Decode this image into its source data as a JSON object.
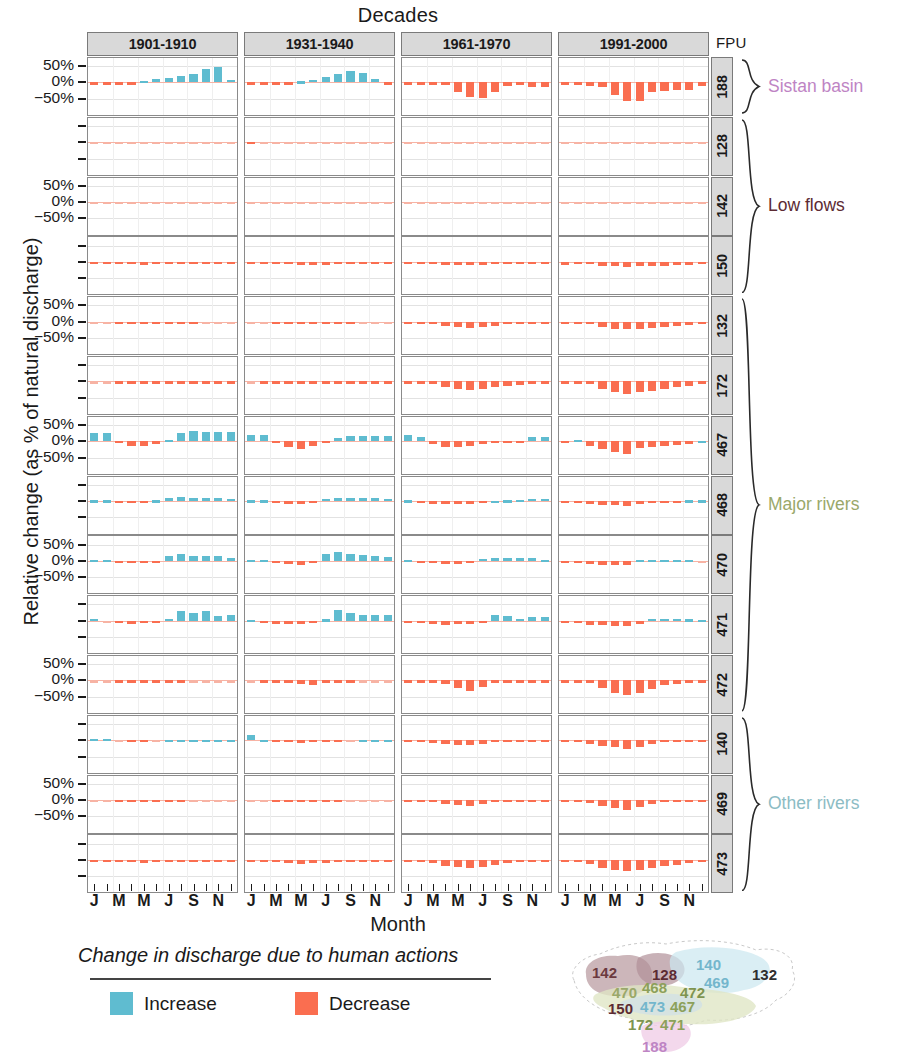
{
  "titles": {
    "top": "Decades",
    "y_axis": "Relative change (as % of natural discharge)",
    "x_axis": "Month",
    "fpu_header": "FPU"
  },
  "legend": {
    "title": "Change in discharge due to human actions",
    "increase_label": "Increase",
    "decrease_label": "Decrease",
    "increase_color": "#5FBCD0",
    "decrease_color": "#FA6E50"
  },
  "groups": [
    {
      "label": "Sistan basin",
      "color": "#BE84C4",
      "rows": [
        "188"
      ]
    },
    {
      "label": "Low flows",
      "color": "#5C2B33",
      "rows": [
        "128",
        "142",
        "150"
      ]
    },
    {
      "label": "Major rivers",
      "color": "#9AA86A",
      "rows": [
        "132",
        "172",
        "467",
        "468",
        "470",
        "471",
        "472"
      ]
    },
    {
      "label": "Other rivers",
      "color": "#8CBCC4",
      "rows": [
        "140",
        "469",
        "473"
      ]
    }
  ],
  "map": {
    "labels": [
      {
        "text": "142",
        "color": "#6B3A3F",
        "x": 36,
        "y": 30
      },
      {
        "text": "128",
        "color": "#5C2B33",
        "x": 96,
        "y": 32
      },
      {
        "text": "140",
        "color": "#73B6CC",
        "x": 140,
        "y": 22
      },
      {
        "text": "469",
        "color": "#73B6CC",
        "x": 148,
        "y": 40
      },
      {
        "text": "132",
        "color": "#2F2F2F",
        "x": 196,
        "y": 32
      },
      {
        "text": "470",
        "color": "#9AA86A",
        "x": 56,
        "y": 50
      },
      {
        "text": "468",
        "color": "#8CA05A",
        "x": 86,
        "y": 45
      },
      {
        "text": "472",
        "color": "#7E9450",
        "x": 124,
        "y": 50
      },
      {
        "text": "150",
        "color": "#5C2B33",
        "x": 52,
        "y": 66
      },
      {
        "text": "473",
        "color": "#73B6CC",
        "x": 84,
        "y": 64
      },
      {
        "text": "467",
        "color": "#8CA05A",
        "x": 114,
        "y": 64
      },
      {
        "text": "172",
        "color": "#7E9450",
        "x": 72,
        "y": 82
      },
      {
        "text": "471",
        "color": "#8CA05A",
        "x": 104,
        "y": 82
      },
      {
        "text": "188",
        "color": "#BE84C4",
        "x": 86,
        "y": 104
      }
    ]
  },
  "chart_data": {
    "type": "bar",
    "title": "Decades",
    "xlabel": "Month",
    "ylabel": "Relative change (as % of natural discharge)",
    "ylim": [
      -100,
      75
    ],
    "yticks": [
      50,
      0,
      -50
    ],
    "ytick_labels": [
      "50%",
      "0%",
      "−50%"
    ],
    "grid": true,
    "legend_position": "bottom",
    "facet_cols": [
      "1901-1910",
      "1931-1940",
      "1961-1970",
      "1991-2000"
    ],
    "facet_rows": [
      "188",
      "128",
      "142",
      "150",
      "132",
      "172",
      "467",
      "468",
      "470",
      "471",
      "472",
      "140",
      "469",
      "473"
    ],
    "x": [
      "J",
      "F",
      "M",
      "A",
      "M",
      "J",
      "J",
      "A",
      "S",
      "O",
      "N",
      "D"
    ],
    "xtick_labels": [
      "J",
      "M",
      "M",
      "J",
      "S",
      "N"
    ],
    "values": {
      "188": {
        "1901-1910": [
          -3,
          -3,
          -3,
          -1,
          5,
          10,
          14,
          20,
          26,
          40,
          48,
          8
        ],
        "1931-1940": [
          -3,
          -3,
          -3,
          -3,
          3,
          8,
          16,
          26,
          34,
          30,
          10,
          -1
        ],
        "1961-1970": [
          -8,
          -8,
          -8,
          -8,
          -28,
          -46,
          -48,
          -30,
          -12,
          -1,
          -14,
          -14
        ],
        "1991-2000": [
          -8,
          -8,
          -12,
          -14,
          -38,
          -58,
          -56,
          -30,
          -26,
          -24,
          -22,
          -12
        ]
      },
      "128": {
        "1901-1910": [
          0,
          0,
          0,
          0,
          0,
          0,
          0,
          0,
          0,
          0,
          0,
          0
        ],
        "1931-1940": [
          -6,
          0,
          0,
          0,
          0,
          0,
          0,
          0,
          0,
          0,
          0,
          0
        ],
        "1961-1970": [
          0,
          0,
          0,
          0,
          0,
          0,
          0,
          0,
          0,
          0,
          0,
          0
        ],
        "1991-2000": [
          0,
          0,
          0,
          0,
          0,
          0,
          0,
          0,
          0,
          0,
          0,
          0
        ]
      },
      "142": {
        "1901-1910": [
          0,
          0,
          0,
          0,
          0,
          0,
          0,
          0,
          0,
          0,
          0,
          0
        ],
        "1931-1940": [
          0,
          0,
          0,
          0,
          0,
          0,
          0,
          0,
          0,
          0,
          0,
          0
        ],
        "1961-1970": [
          0,
          0,
          0,
          0,
          0,
          0,
          0,
          0,
          0,
          0,
          0,
          0
        ],
        "1991-2000": [
          0,
          0,
          0,
          0,
          0,
          0,
          0,
          0,
          0,
          0,
          0,
          0
        ]
      },
      "150": {
        "1901-1910": [
          -1,
          -1,
          -2,
          -7,
          -9,
          -8,
          -8,
          -8,
          -7,
          -2,
          -1,
          -1
        ],
        "1931-1940": [
          -1,
          -1,
          -3,
          -7,
          -10,
          -11,
          -9,
          -7,
          -4,
          -2,
          -1,
          -1
        ],
        "1961-1970": [
          -4,
          -3,
          -3,
          -9,
          -9,
          -10,
          -9,
          -7,
          -5,
          -4,
          -6,
          -6
        ],
        "1991-2000": [
          -9,
          -6,
          -6,
          -12,
          -14,
          -15,
          -14,
          -13,
          -12,
          -11,
          -10,
          -7
        ]
      },
      "132": {
        "1901-1910": [
          0,
          0,
          -1,
          -2,
          -3,
          -3,
          -3,
          -2,
          -1,
          0,
          0,
          0
        ],
        "1931-1940": [
          0,
          0,
          -2,
          -6,
          -7,
          -7,
          -6,
          -3,
          -1,
          0,
          0,
          0
        ],
        "1961-1970": [
          -4,
          -4,
          -3,
          -12,
          -16,
          -19,
          -16,
          -12,
          -8,
          -6,
          -5,
          -5
        ],
        "1991-2000": [
          -6,
          -6,
          -7,
          -18,
          -22,
          -24,
          -22,
          -20,
          -16,
          -12,
          -9,
          -7
        ]
      },
      "172": {
        "1901-1910": [
          0,
          0,
          -1,
          -3,
          -4,
          -4,
          -4,
          -3,
          -2,
          -1,
          -1,
          -1
        ],
        "1931-1940": [
          0,
          -1,
          -3,
          -8,
          -9,
          -9,
          -8,
          -5,
          -3,
          -2,
          -1,
          -1
        ],
        "1961-1970": [
          -3,
          -3,
          -7,
          -16,
          -22,
          -26,
          -22,
          -17,
          -13,
          -10,
          -8,
          -7
        ],
        "1991-2000": [
          -5,
          -5,
          -9,
          -24,
          -34,
          -38,
          -34,
          -30,
          -24,
          -18,
          -13,
          -9
        ]
      },
      "467": {
        "1901-1910": [
          26,
          26,
          -6,
          -16,
          -16,
          -8,
          4,
          24,
          32,
          28,
          28,
          28
        ],
        "1931-1940": [
          20,
          20,
          -6,
          -18,
          -24,
          -16,
          -2,
          10,
          16,
          16,
          16,
          16
        ],
        "1961-1970": [
          20,
          12,
          -10,
          -18,
          -18,
          -16,
          -10,
          -2,
          -2,
          -2,
          14,
          14
        ],
        "1991-2000": [
          -2,
          4,
          -16,
          -24,
          -32,
          -38,
          -22,
          -18,
          -14,
          -12,
          -8,
          2
        ]
      },
      "468": {
        "1901-1910": [
          2,
          2,
          -5,
          -6,
          -6,
          2,
          10,
          12,
          8,
          8,
          8,
          6
        ],
        "1931-1940": [
          2,
          2,
          -5,
          -8,
          -9,
          -2,
          6,
          9,
          9,
          9,
          9,
          6
        ],
        "1961-1970": [
          2,
          -2,
          -8,
          -10,
          -10,
          -9,
          -5,
          1,
          2,
          3,
          6,
          6
        ],
        "1991-2000": [
          -2,
          -2,
          -10,
          -12,
          -13,
          -14,
          -10,
          -6,
          -3,
          -2,
          2,
          2
        ]
      },
      "470": {
        "1901-1910": [
          4,
          2,
          -6,
          -8,
          -8,
          -4,
          16,
          22,
          16,
          14,
          14,
          10
        ],
        "1931-1940": [
          4,
          2,
          -7,
          -10,
          -12,
          -8,
          20,
          26,
          22,
          18,
          16,
          12
        ],
        "1961-1970": [
          4,
          -2,
          -8,
          -10,
          -10,
          -8,
          6,
          10,
          9,
          9,
          10,
          2
        ],
        "1991-2000": [
          -2,
          -4,
          -10,
          -13,
          -14,
          -12,
          2,
          4,
          4,
          3,
          2,
          0
        ]
      },
      "471": {
        "1901-1910": [
          6,
          0,
          -8,
          -10,
          -6,
          -4,
          6,
          28,
          22,
          30,
          14,
          16
        ],
        "1931-1940": [
          2,
          -2,
          -10,
          -11,
          -10,
          -8,
          4,
          32,
          24,
          18,
          16,
          16
        ],
        "1961-1970": [
          -3,
          -6,
          -11,
          -12,
          -11,
          -11,
          -3,
          16,
          14,
          6,
          10,
          12
        ],
        "1991-2000": [
          -3,
          -7,
          -13,
          -14,
          -16,
          -17,
          -9,
          5,
          6,
          5,
          4,
          2
        ]
      },
      "472": {
        "1901-1910": [
          0,
          0,
          -1,
          -4,
          -5,
          -4,
          -2,
          -1,
          0,
          0,
          0,
          0
        ],
        "1931-1940": [
          0,
          -1,
          -2,
          -8,
          -12,
          -13,
          -5,
          -2,
          -1,
          0,
          0,
          0
        ],
        "1961-1970": [
          -2,
          -2,
          -3,
          -10,
          -24,
          -32,
          -20,
          -4,
          -2,
          -2,
          -2,
          -2
        ],
        "1991-2000": [
          -5,
          -5,
          -6,
          -22,
          -40,
          -46,
          -40,
          -26,
          -14,
          -10,
          -8,
          -6
        ]
      },
      "140": {
        "1901-1910": [
          4,
          3,
          0,
          -1,
          -1,
          0,
          1,
          2,
          2,
          2,
          2,
          2
        ],
        "1931-1940": [
          16,
          2,
          -4,
          -7,
          -8,
          -6,
          -3,
          -1,
          0,
          1,
          2,
          2
        ],
        "1961-1970": [
          -2,
          -3,
          -8,
          -12,
          -14,
          -16,
          -12,
          -7,
          -4,
          -3,
          -2,
          -2
        ],
        "1991-2000": [
          -4,
          -6,
          -12,
          -18,
          -22,
          -26,
          -20,
          -12,
          -7,
          -5,
          -4,
          -3
        ]
      },
      "469": {
        "1901-1910": [
          0,
          0,
          -1,
          -2,
          -3,
          -3,
          -2,
          -1,
          0,
          0,
          0,
          0
        ],
        "1931-1940": [
          0,
          0,
          -2,
          -5,
          -6,
          -5,
          -3,
          -1,
          0,
          0,
          0,
          0
        ],
        "1961-1970": [
          -2,
          -2,
          -6,
          -12,
          -16,
          -18,
          -13,
          -7,
          -4,
          -3,
          -2,
          -2
        ],
        "1991-2000": [
          -3,
          -3,
          -8,
          -17,
          -26,
          -30,
          -22,
          -12,
          -7,
          -5,
          -4,
          -3
        ]
      },
      "473": {
        "1901-1910": [
          -1,
          -1,
          -4,
          -8,
          -9,
          -8,
          -7,
          -5,
          -3,
          -2,
          -1,
          -1
        ],
        "1931-1940": [
          -1,
          -2,
          -6,
          -10,
          -12,
          -11,
          -9,
          -6,
          -4,
          -2,
          -2,
          -1
        ],
        "1961-1970": [
          -3,
          -3,
          -9,
          -18,
          -22,
          -24,
          -21,
          -16,
          -11,
          -8,
          -6,
          -5
        ],
        "1991-2000": [
          -5,
          -5,
          -12,
          -26,
          -32,
          -34,
          -31,
          -26,
          -20,
          -15,
          -11,
          -8
        ]
      }
    }
  }
}
